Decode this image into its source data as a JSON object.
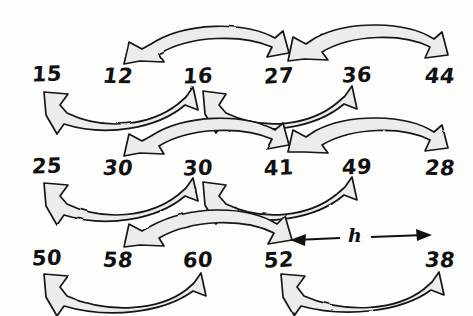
{
  "figure": {
    "style": "hand-drawn sketch",
    "gap_label": "h",
    "stroke_color": "#111111",
    "fill_color": "#ececec",
    "background_color": "#fdfdfc"
  },
  "rows": [
    {
      "name": "row-1",
      "values": [
        "15",
        "12",
        "16",
        "27",
        "36",
        "44"
      ]
    },
    {
      "name": "row-2",
      "values": [
        "25",
        "30",
        "30",
        "41",
        "49",
        "28"
      ]
    },
    {
      "name": "row-3",
      "values": [
        "50",
        "58",
        "60",
        "52",
        "38"
      ]
    }
  ],
  "arrows": [
    {
      "name": "arrow-12-27",
      "from": "12",
      "to": "27",
      "direction": "both",
      "curve": "arch-up"
    },
    {
      "name": "arrow-27-44",
      "from": "27",
      "to": "44",
      "direction": "both",
      "curve": "arch-up"
    },
    {
      "name": "arrow-15-16",
      "from": "15",
      "to": "16",
      "direction": "both",
      "curve": "dip-down"
    },
    {
      "name": "arrow-16-36",
      "from": "16",
      "to": "36",
      "direction": "both",
      "curve": "dip-down"
    },
    {
      "name": "arrow-30-41",
      "from": "30",
      "to": "41",
      "direction": "both",
      "curve": "arch-up"
    },
    {
      "name": "arrow-41-28",
      "from": "41",
      "to": "28",
      "direction": "both",
      "curve": "arch-up"
    },
    {
      "name": "arrow-25-30",
      "from": "25",
      "to": "30",
      "direction": "both",
      "curve": "dip-down"
    },
    {
      "name": "arrow-30-49",
      "from": "30",
      "to": "49",
      "direction": "both",
      "curve": "dip-down"
    },
    {
      "name": "arrow-58-52",
      "from": "58",
      "to": "52",
      "direction": "both",
      "curve": "arch-up"
    },
    {
      "name": "arrow-50-60",
      "from": "50",
      "to": "60",
      "direction": "both",
      "curve": "dip-down"
    },
    {
      "name": "arrow-52-38",
      "from": "52",
      "to": "38",
      "direction": "both",
      "curve": "dip-down"
    },
    {
      "name": "arrow-gap-h",
      "from": "52",
      "to": "38",
      "direction": "both",
      "curve": "straight",
      "label": "h"
    }
  ],
  "positions": {
    "row1": {
      "y": 74,
      "xs": [
        47,
        118,
        198,
        279,
        357,
        440
      ]
    },
    "row2": {
      "y": 165,
      "xs": [
        47,
        118,
        198,
        279,
        357,
        440
      ]
    },
    "row3": {
      "y": 256,
      "xs": [
        47,
        118,
        198,
        279,
        440
      ]
    },
    "h_label": {
      "x": 355,
      "y": 237
    }
  }
}
